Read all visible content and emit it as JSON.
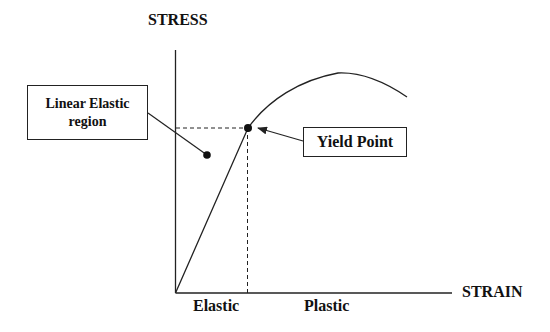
{
  "diagram": {
    "type": "stress-strain curve",
    "y_axis_label": "STRESS",
    "x_axis_label": "STRAIN",
    "region_labels": {
      "elastic": "Elastic",
      "plastic": "Plastic"
    },
    "callouts": {
      "linear_elastic": {
        "line1": "Linear Elastic",
        "line2": "region"
      },
      "yield_point": "Yield Point"
    },
    "colors": {
      "line": "#222222",
      "background": "#ffffff"
    }
  }
}
